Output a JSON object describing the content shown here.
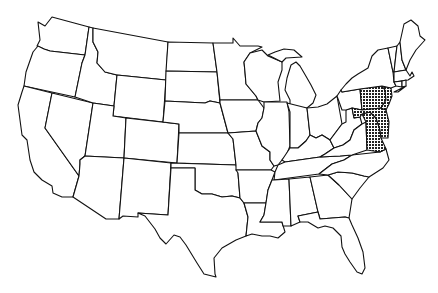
{
  "map": {
    "title": "United States outline map",
    "style": "black outline on white, no labels",
    "highlight_pattern": "checkered grid",
    "highlighted_region": [
      "Eastern Pennsylvania",
      "New Jersey (partial)",
      "Delaware",
      "Maryland",
      "Eastern Virginia"
    ],
    "colors": {
      "background": "#ffffff",
      "outline": "#111111",
      "highlight": "#222222"
    }
  }
}
